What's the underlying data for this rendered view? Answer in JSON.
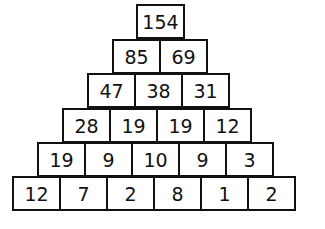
{
  "pyramid": {
    "rows": [
      [
        "154"
      ],
      [
        "85",
        "69"
      ],
      [
        "47",
        "38",
        "31"
      ],
      [
        "28",
        "19",
        "19",
        "12"
      ],
      [
        "19",
        "9",
        "10",
        "9",
        "3"
      ],
      [
        "12",
        "7",
        "2",
        "8",
        "1",
        "2"
      ]
    ]
  }
}
